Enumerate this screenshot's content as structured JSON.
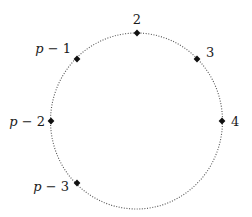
{
  "diagram": {
    "type": "cycle-diagram",
    "circle": {
      "cx": 136.5,
      "cy": 121,
      "rx": 86,
      "ry": 88,
      "stroke": "#555555",
      "style": "dotted"
    },
    "marker_color": "#111111",
    "nodes": [
      {
        "id": "n2",
        "label": "2",
        "x": 137,
        "y": 33,
        "lx": 137,
        "ly": 24,
        "anchor": "middle"
      },
      {
        "id": "n3",
        "label": "3",
        "x": 197,
        "y": 59,
        "lx": 206,
        "ly": 57,
        "anchor": "start"
      },
      {
        "id": "n4",
        "label": "4",
        "x": 222,
        "y": 121,
        "lx": 231,
        "ly": 126,
        "anchor": "start"
      },
      {
        "id": "nm1",
        "label": "p − 1",
        "x": 77,
        "y": 59,
        "lx": 71,
        "ly": 53,
        "anchor": "end"
      },
      {
        "id": "nm2",
        "label": "p − 2",
        "x": 51,
        "y": 121,
        "lx": 45,
        "ly": 126,
        "anchor": "end"
      },
      {
        "id": "nm3",
        "label": "p − 3",
        "x": 77,
        "y": 183,
        "lx": 69,
        "ly": 191,
        "anchor": "end"
      }
    ]
  }
}
